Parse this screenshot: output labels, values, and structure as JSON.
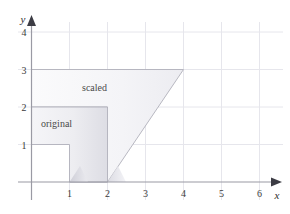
{
  "figure": {
    "background_color": "#ffffff"
  },
  "axes": {
    "x_axis": {
      "name": "x",
      "ticks": [
        {
          "value": 1,
          "label": "1"
        },
        {
          "value": 2,
          "label": "2"
        },
        {
          "value": 3,
          "label": "3"
        },
        {
          "value": 4,
          "label": "4"
        },
        {
          "value": 5,
          "label": "5"
        },
        {
          "value": 6,
          "label": "6"
        }
      ],
      "range": [
        -0.3,
        6.5
      ],
      "arrow": true,
      "color": "#8c8c8c"
    },
    "y_axis": {
      "name": "y",
      "ticks": [
        {
          "value": 1,
          "label": "1"
        },
        {
          "value": 2,
          "label": "2"
        },
        {
          "value": 3,
          "label": "3"
        },
        {
          "value": 4,
          "label": "4"
        }
      ],
      "range": [
        -0.55,
        4.5
      ],
      "arrow": true,
      "color": "#8c8c8c"
    },
    "grid": {
      "visible": true,
      "color": "#e3e3ea",
      "x_lines": [
        1,
        2,
        3,
        4,
        5,
        6
      ],
      "y_lines": [
        1,
        2,
        3,
        4
      ]
    }
  },
  "shapes": [
    {
      "id": "original",
      "label": "original",
      "label_position": {
        "x": 0.28,
        "y": 1.7
      },
      "outline_color": "#a9a9b4",
      "fill": "gradient-light",
      "vertices": [
        {
          "x": 0,
          "y": 1.5
        },
        {
          "x": 1,
          "y": 1.5
        },
        {
          "x": 2,
          "y": 1.5
        },
        {
          "x": 2,
          "y": 0
        },
        {
          "x": 1,
          "y": 0
        },
        {
          "x": 1,
          "y": 1
        },
        {
          "x": 0,
          "y": 1
        }
      ]
    },
    {
      "id": "scaled",
      "label": "scaled",
      "label_position": {
        "x": 1.35,
        "y": 2.45
      },
      "outline_color": "#a9a9b4",
      "fill": "gradient-light",
      "vertices": [
        {
          "x": 0,
          "y": 3
        },
        {
          "x": 4,
          "y": 3
        },
        {
          "x": 2,
          "y": 0
        },
        {
          "x": 1,
          "y": 0
        },
        {
          "x": 2,
          "y": 1.5
        },
        {
          "x": 0,
          "y": 1.5
        }
      ]
    }
  ],
  "colors": {
    "grid": "#e3e3ea",
    "axis": "#9a9aa4",
    "outline": "#a9a9b4",
    "text": "#3a3a3a",
    "shade_dark": "#d6d6dd",
    "shade_light": "#f2f2f5"
  }
}
